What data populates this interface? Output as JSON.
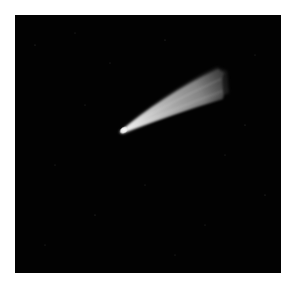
{
  "image": {
    "subject": "comet",
    "description": "Comet with bright head and fanning tail against a black starry sky",
    "background_color": "#020202",
    "margin_color": "#ffffff"
  }
}
